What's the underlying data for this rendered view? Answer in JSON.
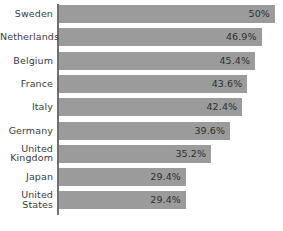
{
  "chart": {
    "type": "bar",
    "orientation": "horizontal",
    "bar_color": "#9b9b9b",
    "axis_color": "#6f6f6f",
    "background": "#ffffff",
    "axis_label_color": "#3b3b3b",
    "value_label_color": "#2e2e2e"
  },
  "chart_data": {
    "type": "bar",
    "title": "",
    "subtitle": "",
    "xlabel": "",
    "ylabel": "",
    "grid": false,
    "legend": false,
    "orientation": "horizontal",
    "xlim": [
      0,
      50
    ],
    "categories": [
      "Sweden",
      "Netherlands",
      "Belgium",
      "France",
      "Italy",
      "Germany",
      "United\nKingdom",
      "Japan",
      "United\nStates"
    ],
    "values": [
      50,
      46.9,
      45.4,
      43.6,
      42.4,
      39.6,
      35.2,
      29.4,
      29.4
    ],
    "value_labels": [
      "50%",
      "46.9%",
      "45.4%",
      "43.6%",
      "42.4%",
      "39.6%",
      "35.2%",
      "29.4%",
      "29.4%"
    ]
  },
  "rows": [
    {
      "label": "Sweden",
      "lines": 1,
      "value": 50,
      "value_label": "50%"
    },
    {
      "label": "Netherlands",
      "lines": 1,
      "value": 46.9,
      "value_label": "46.9%"
    },
    {
      "label": "Belgium",
      "lines": 1,
      "value": 45.4,
      "value_label": "45.4%"
    },
    {
      "label": "France",
      "lines": 1,
      "value": 43.6,
      "value_label": "43.6%"
    },
    {
      "label": "Italy",
      "lines": 1,
      "value": 42.4,
      "value_label": "42.4%"
    },
    {
      "label": "Germany",
      "lines": 1,
      "value": 39.6,
      "value_label": "39.6%"
    },
    {
      "label": "United\nKingdom",
      "lines": 2,
      "value": 35.2,
      "value_label": "35.2%"
    },
    {
      "label": "Japan",
      "lines": 1,
      "value": 29.4,
      "value_label": "29.4%"
    },
    {
      "label": "United\nStates",
      "lines": 2,
      "value": 29.4,
      "value_label": "29.4%"
    }
  ]
}
